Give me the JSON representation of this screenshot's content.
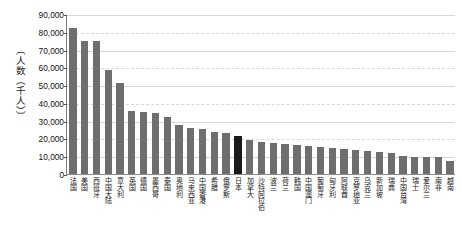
{
  "chart_data": {
    "type": "bar",
    "title": "",
    "subtitle": "",
    "xlabel": "",
    "ylabel": "〔人数（千人）〕",
    "ylim": [
      0,
      90000
    ],
    "ytick_labels": [
      "90,000",
      "80,000",
      "70,000",
      "60,000",
      "50,000",
      "40,000",
      "30,000",
      "20,000",
      "10,000",
      "0"
    ],
    "ytick_values": [
      90000,
      80000,
      70000,
      60000,
      50000,
      40000,
      30000,
      20000,
      10000,
      0
    ],
    "grid": true,
    "legend": "none",
    "bar_color": "#6e6e6e",
    "highlight_color": "#1a1a1a",
    "highlight_category": "日本",
    "categories": [
      "法国",
      "美国",
      "西班牙",
      "中国大陆",
      "意大利",
      "英国",
      "德国",
      "墨西哥",
      "泰国",
      "奥地利",
      "马来西亚",
      "中国香港",
      "希腊",
      "俄罗斯",
      "日本",
      "加拿大",
      "沙特阿拉伯",
      "波兰",
      "荷兰",
      "韩国",
      "中国澳门",
      "葡萄牙",
      "匈牙利",
      "阿联酋",
      "克罗地亚",
      "乌克兰",
      "新加坡",
      "瑞典",
      "中国台湾",
      "瑞士",
      "爱尔兰",
      "南非",
      "越南"
    ],
    "values": [
      82600,
      75600,
      75500,
      59300,
      52000,
      35800,
      35500,
      34900,
      32500,
      28000,
      26300,
      26000,
      24000,
      23700,
      22000,
      19500,
      18500,
      18000,
      17500,
      17000,
      16300,
      15700,
      15200,
      14900,
      14100,
      13700,
      13200,
      12600,
      10700,
      10400,
      10200,
      10100,
      8000
    ]
  }
}
